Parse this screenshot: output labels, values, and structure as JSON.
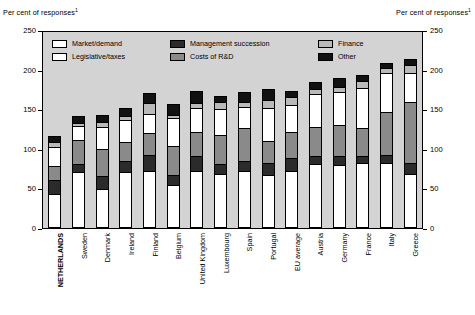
{
  "axis_caption_left": "Per cent of responses",
  "axis_caption_right": "Per cent of responses",
  "caption_superscript": "1",
  "legend": [
    {
      "label": "Market/demand",
      "color": "#ffffff"
    },
    {
      "label": "Management succession",
      "color": "#2b2b2b"
    },
    {
      "label": "Finance",
      "color": "#b9b9b9"
    },
    {
      "label": "Legislative/taxes",
      "color": "#ffffff"
    },
    {
      "label": "Costs of R&D",
      "color": "#8a8a8a"
    },
    {
      "label": "Other",
      "color": "#111111"
    }
  ],
  "chart_data": {
    "type": "bar",
    "title": "",
    "subtitle": "",
    "xlabel": "",
    "ylabel": "Per cent of responses",
    "ylim": [
      0,
      250
    ],
    "yticks": [
      0,
      50,
      100,
      150,
      200,
      250
    ],
    "grid": false,
    "legend_position": "top-inside",
    "stacked": true,
    "categories": [
      "NETHERLANDS",
      "Sweden",
      "Denmark",
      "Ireland",
      "Finland",
      "Belgium",
      "United Kingdom",
      "Luxembourg",
      "Spain",
      "Portugal",
      "EU average",
      "Austria",
      "Germany",
      "France",
      "Italy",
      "Greece"
    ],
    "highlight_category": "NETHERLANDS",
    "series": [
      {
        "name": "Market/demand",
        "color": "#ffffff",
        "values": [
          42,
          69,
          47,
          70,
          71,
          53,
          70,
          67,
          71,
          66,
          71,
          79,
          78,
          81,
          81,
          67
        ]
      },
      {
        "name": "Management succession",
        "color": "#2b2b2b",
        "values": [
          18,
          11,
          17,
          13,
          20,
          12,
          20,
          13,
          12,
          15,
          16,
          11,
          11,
          9,
          10,
          13
        ]
      },
      {
        "name": "Costs of R&D",
        "color": "#8a8a8a",
        "values": [
          17,
          30,
          35,
          25,
          28,
          38,
          31,
          37,
          42,
          28,
          33,
          37,
          40,
          36,
          55,
          78
        ]
      },
      {
        "name": "Legislative/taxes",
        "color": "#ffffff",
        "values": [
          25,
          19,
          28,
          28,
          25,
          35,
          30,
          33,
          28,
          42,
          35,
          42,
          42,
          50,
          50,
          38
        ]
      },
      {
        "name": "Finance",
        "color": "#b9b9b9",
        "values": [
          7,
          4,
          7,
          5,
          14,
          5,
          6,
          9,
          6,
          11,
          10,
          6,
          7,
          9,
          6,
          10
        ]
      },
      {
        "name": "Other",
        "color": "#111111",
        "values": [
          7,
          9,
          9,
          11,
          12,
          13,
          16,
          8,
          13,
          13,
          8,
          9,
          12,
          8,
          6,
          8
        ]
      }
    ],
    "totals": [
      116,
      142,
      143,
      152,
      170,
      156,
      173,
      167,
      172,
      175,
      173,
      184,
      190,
      193,
      208,
      214
    ]
  }
}
